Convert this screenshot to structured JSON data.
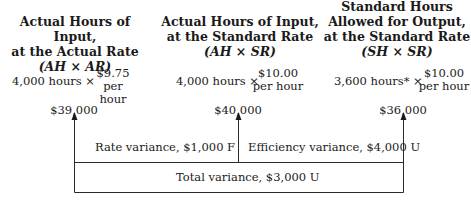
{
  "columns": [
    {
      "header_lines": [
        "Actual Hours of Input,",
        "at the Actual Rate"
      ],
      "formula": "(AH × AR)",
      "quantity": "4,000 hours ×",
      "rate": "$9.75",
      "rate_unit": "per hour",
      "total": "$39,000"
    },
    {
      "header_lines": [
        "Actual Hours of Input,",
        "at the Standard Rate"
      ],
      "formula": "(AH × SR)",
      "quantity": "4,000 hours ×",
      "rate": "$10.00",
      "rate_unit": "per hour",
      "total": "$40,000"
    },
    {
      "header_lines": [
        "Standard Hours",
        "Allowed for Output,",
        "at the Standard Rate"
      ],
      "formula": "(SH × SR)",
      "quantity": "3,600 hours* ×",
      "rate": "$10.00",
      "rate_unit": "per hour",
      "total": "$36,000"
    }
  ],
  "variances": {
    "rate": "Rate variance, $1,000 F",
    "efficiency": "Efficiency variance, $4,000 U",
    "total": "Total variance, $3,000 U"
  }
}
